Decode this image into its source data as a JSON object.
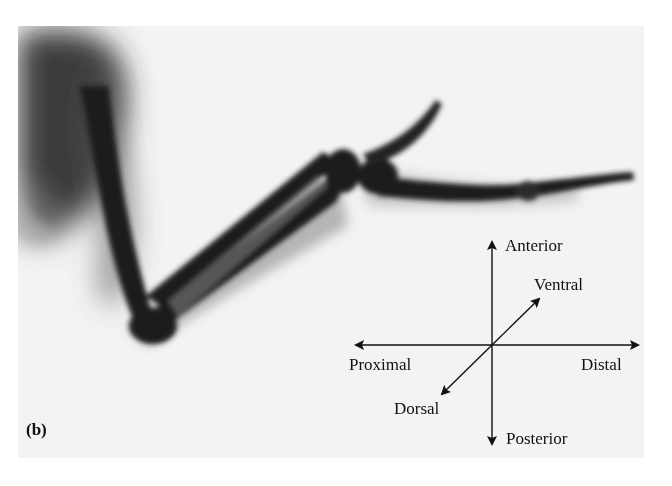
{
  "figure": {
    "panel_label": "(b)",
    "orientation_axes": {
      "anterior": "Anterior",
      "posterior": "Posterior",
      "proximal": "Proximal",
      "distal": "Distal",
      "ventral": "Ventral",
      "dorsal": "Dorsal"
    }
  },
  "colors": {
    "background": "#f3f3f3",
    "bone": "#1a1a1a",
    "soft_tissue": "#6a6a6a"
  }
}
